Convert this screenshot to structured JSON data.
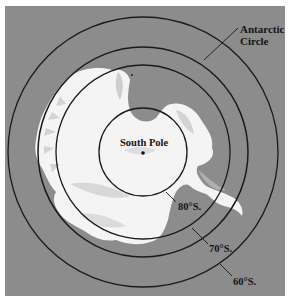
{
  "map": {
    "title": "Antarctica polar view",
    "colors": {
      "ocean": "#8c8c8c",
      "land": "#f6f6f6",
      "land_shade": "#c9c9c9",
      "lines": "#1a1a1a",
      "frame_bg": "#ffffff"
    },
    "center": {
      "x": 143,
      "y": 152
    },
    "circles": [
      {
        "name": "60S",
        "radius": 135,
        "label": "60°S."
      },
      {
        "name": "antarctic-circle",
        "radius": 105,
        "label": "Antarctic Circle"
      },
      {
        "name": "70S",
        "radius": 87,
        "label": "70°S."
      },
      {
        "name": "80S",
        "radius": 44,
        "label": "80°S."
      }
    ],
    "labels": {
      "antarctic_line1": "Antarctic",
      "antarctic_line2": "Circle",
      "south_pole": "South Pole",
      "lat80": "80°S.",
      "lat70": "70°S.",
      "lat60": "60°S."
    }
  }
}
